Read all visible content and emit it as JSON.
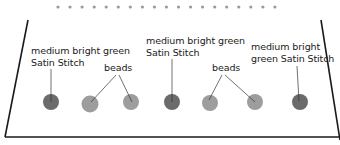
{
  "colors": {
    "outline": "#1a1a1a",
    "dots": "#9a9a9a",
    "satin_stitch": "#6b6b6b",
    "beads": "#9d9d9d",
    "leader": "#333333"
  },
  "top_dots": {
    "count": 19,
    "start_x": 58,
    "spacing": 12.05,
    "y": 7
  },
  "labels": [
    {
      "id": "satin-1",
      "lines": [
        "medium bright green",
        "Satin Stitch"
      ],
      "x": 31,
      "y": 45
    },
    {
      "id": "beads-1",
      "lines": [
        "beads"
      ],
      "x": 104,
      "y": 62
    },
    {
      "id": "satin-2",
      "lines": [
        "medium bright green",
        "Satin Stitch"
      ],
      "x": 146,
      "y": 35
    },
    {
      "id": "beads-2",
      "lines": [
        "beads"
      ],
      "x": 212,
      "y": 62
    },
    {
      "id": "satin-3",
      "lines": [
        "medium bright",
        "green Satin Stitch"
      ],
      "x": 251,
      "y": 41
    }
  ],
  "elements": [
    {
      "type": "satin_stitch",
      "cx": 51,
      "cy": 102,
      "r": 8
    },
    {
      "type": "bead",
      "cx": 90,
      "cy": 104,
      "r": 8.5
    },
    {
      "type": "bead",
      "cx": 131,
      "cy": 102,
      "r": 8
    },
    {
      "type": "satin_stitch",
      "cx": 172,
      "cy": 102,
      "r": 8
    },
    {
      "type": "bead",
      "cx": 210,
      "cy": 103,
      "r": 8
    },
    {
      "type": "bead",
      "cx": 255,
      "cy": 102,
      "r": 8
    },
    {
      "type": "satin_stitch",
      "cx": 300,
      "cy": 102,
      "r": 8
    }
  ],
  "leaders": [
    {
      "x1": 51,
      "y1": 69,
      "x2": 51,
      "y2": 102
    },
    {
      "x1": 116,
      "y1": 75,
      "x2": 91,
      "y2": 102
    },
    {
      "x1": 119,
      "y1": 75,
      "x2": 132,
      "y2": 102
    },
    {
      "x1": 172,
      "y1": 59,
      "x2": 172,
      "y2": 102
    },
    {
      "x1": 222,
      "y1": 75,
      "x2": 209,
      "y2": 100
    },
    {
      "x1": 225,
      "y1": 75,
      "x2": 255,
      "y2": 102
    },
    {
      "x1": 297,
      "y1": 66,
      "x2": 299,
      "y2": 101
    }
  ],
  "outline": {
    "left": {
      "x1": 28,
      "y1": 20,
      "x2": 5,
      "y2": 137
    },
    "right": {
      "x1": 321,
      "y1": 20,
      "x2": 340,
      "y2": 140
    },
    "bottom": {
      "x1": 5,
      "y1": 137,
      "x2": 340,
      "y2": 137
    }
  }
}
